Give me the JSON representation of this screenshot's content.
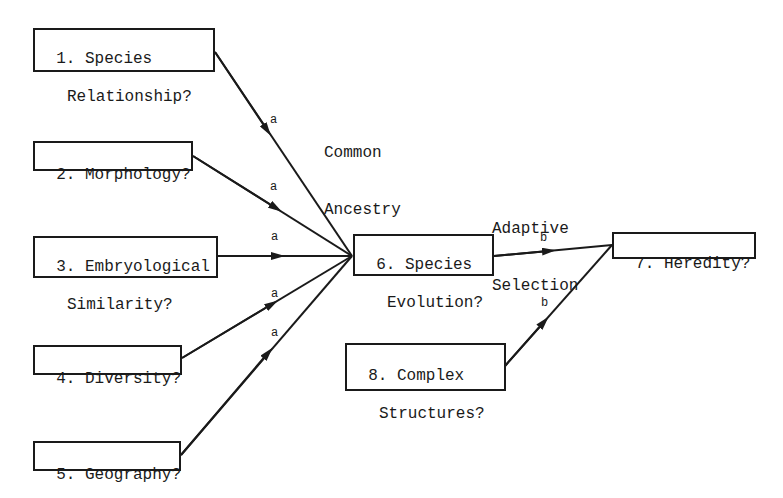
{
  "nodes": [
    {
      "id": 1,
      "line1": "1. Species",
      "line2": "Relationship?"
    },
    {
      "id": 2,
      "line1": "2. Morphology?"
    },
    {
      "id": 3,
      "line1": "3. Embryological",
      "line2": "Similarity?"
    },
    {
      "id": 4,
      "line1": "4. Diversity?"
    },
    {
      "id": 5,
      "line1": "5. Geography?"
    },
    {
      "id": 6,
      "line1": "6. Species",
      "line2": "Evolution?"
    },
    {
      "id": 7,
      "line1": "7. Heredity?"
    },
    {
      "id": 8,
      "line1": "8. Complex",
      "line2": "Structures?"
    }
  ],
  "group_labels": {
    "common_ancestry": {
      "line1": "Common",
      "line2": "Ancestry"
    },
    "adaptive_selection": {
      "line1": "Adaptive",
      "line2": "Selection"
    }
  },
  "edges": [
    {
      "from": 1,
      "to": 6,
      "label": "a"
    },
    {
      "from": 2,
      "to": 6,
      "label": "a"
    },
    {
      "from": 3,
      "to": 6,
      "label": "a"
    },
    {
      "from": 4,
      "to": 6,
      "label": "a"
    },
    {
      "from": 5,
      "to": 6,
      "label": "a"
    },
    {
      "from": 6,
      "to": 7,
      "label": "b"
    },
    {
      "from": 8,
      "to": 7,
      "label": "b"
    }
  ]
}
